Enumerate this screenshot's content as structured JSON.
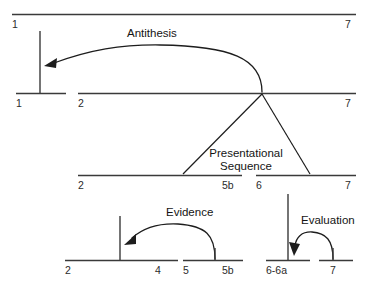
{
  "diagram": {
    "type": "rst-rhetorical-structure-tree",
    "title": "Presentational Sequence",
    "relations": [
      {
        "name": "antithesis",
        "label": "Antithesis"
      },
      {
        "name": "presentational-sequence",
        "label_line1": "Presentational",
        "label_line2": "Sequence"
      },
      {
        "name": "evidence",
        "label": "Evidence"
      },
      {
        "name": "evaluation",
        "label": "Evaluation"
      }
    ],
    "levels": [
      {
        "name": "level-1-root",
        "spans": [
          {
            "name": "span-1-7",
            "start_label": "1",
            "end_label": "7",
            "label_position": "below"
          }
        ]
      },
      {
        "name": "level-2",
        "spans": [
          {
            "name": "span-1",
            "start_label": "1"
          },
          {
            "name": "span-2-7",
            "start_label": "2",
            "end_label": "7"
          }
        ]
      },
      {
        "name": "level-3",
        "spans": [
          {
            "name": "span-2-5b",
            "start_label": "2",
            "end_label": "5b"
          },
          {
            "name": "span-6-7",
            "start_label": "6",
            "end_label": "7"
          }
        ]
      },
      {
        "name": "level-4",
        "spans": [
          {
            "name": "span-2-4",
            "start_label": "2",
            "end_label": "4"
          },
          {
            "name": "span-5-5b",
            "start_label": "5",
            "end_label": "5b"
          },
          {
            "name": "span-6-6a",
            "start_label": "6-6a"
          },
          {
            "name": "span-7",
            "start_label": "7"
          }
        ]
      }
    ],
    "labels": {
      "top_left": "1",
      "top_right": "7",
      "row2_left": "1",
      "row2_mid": "2",
      "row2_right": "7",
      "row3_left": "2",
      "row3_a": "5b",
      "row3_b": "6",
      "row3_right": "7",
      "row4_a": "2",
      "row4_b": "4",
      "row4_c": "5",
      "row4_d": "5b",
      "row4_e": "6-6a",
      "row4_f": "7"
    },
    "colors": {
      "line": "#3a3a3a",
      "stroke": "#1d1d1d",
      "text": "#2b2b2b",
      "background": "#ffffff"
    }
  }
}
